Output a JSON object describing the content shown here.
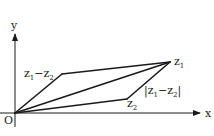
{
  "diagram": {
    "axes": {
      "x_label": "x",
      "y_label": "y",
      "origin_label": "O"
    },
    "points": {
      "z1": {
        "base": "z",
        "sub": "1"
      },
      "z2": {
        "base": "z",
        "sub": "2"
      },
      "diff": {
        "prefix": "z",
        "sub1": "1",
        "mid": "−z",
        "sub2": "2"
      }
    },
    "labels": {
      "modulus": {
        "open": "|z",
        "sub1": "1",
        "mid": "−z",
        "sub2": "2",
        "close": "|"
      }
    },
    "colors": {
      "ink": "#1a1a1a",
      "background": "#ffffff"
    }
  }
}
